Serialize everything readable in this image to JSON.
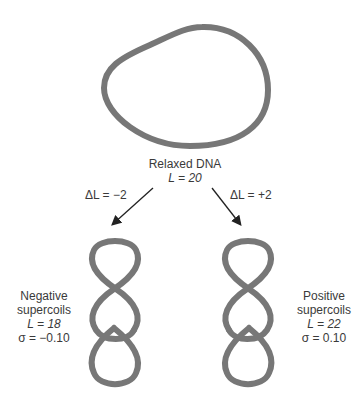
{
  "colors": {
    "strand": "#777777",
    "text": "#3a3a3a",
    "arrow": "#222222"
  },
  "relaxed": {
    "title": "Relaxed DNA",
    "linking": "L = 20"
  },
  "arrow_left": {
    "label": "ΔL = −2"
  },
  "arrow_right": {
    "label": "ΔL = +2"
  },
  "negative": {
    "line1": "Negative",
    "line2": "supercoils",
    "linking": "L = 18",
    "sigma": "σ = −0.10"
  },
  "positive": {
    "line1": "Positive",
    "line2": "supercoils",
    "linking": "L = 22",
    "sigma": "σ = 0.10"
  }
}
